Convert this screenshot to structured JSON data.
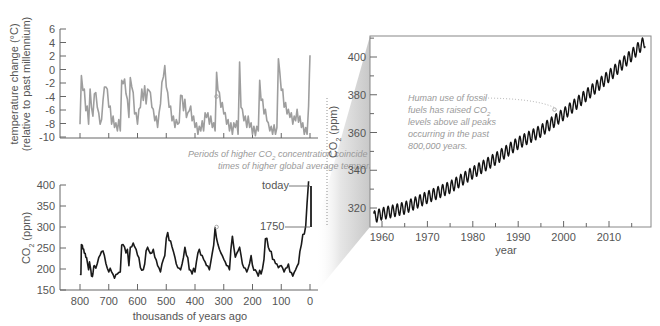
{
  "chart_data": [
    {
      "id": "temperature",
      "type": "line",
      "title": "",
      "xlabel": "",
      "ylabel": "temperature change (°C)",
      "ylabel2": "(relative to past millennium)",
      "xlim": [
        800,
        0
      ],
      "ylim": [
        -10,
        6
      ],
      "yticks": [
        6,
        4,
        2,
        0,
        -2,
        -4,
        -6,
        -8,
        -10
      ],
      "xticks": [
        800,
        700,
        600,
        500,
        400,
        300,
        200,
        100,
        0
      ],
      "color": "#9e9e9e",
      "series": [
        {
          "name": "temperature anomaly",
          "x": [
            800,
            795,
            790,
            785,
            780,
            775,
            770,
            765,
            760,
            755,
            750,
            745,
            740,
            735,
            730,
            725,
            720,
            715,
            710,
            705,
            700,
            695,
            690,
            685,
            680,
            675,
            670,
            665,
            660,
            655,
            650,
            645,
            640,
            635,
            630,
            625,
            620,
            615,
            610,
            605,
            600,
            595,
            590,
            585,
            580,
            575,
            570,
            565,
            560,
            555,
            550,
            545,
            540,
            535,
            530,
            525,
            520,
            515,
            510,
            505,
            500,
            495,
            490,
            485,
            480,
            475,
            470,
            465,
            460,
            455,
            450,
            445,
            440,
            435,
            430,
            425,
            420,
            415,
            410,
            405,
            400,
            395,
            390,
            385,
            380,
            375,
            370,
            365,
            360,
            355,
            350,
            345,
            340,
            335,
            330,
            325,
            320,
            315,
            310,
            305,
            300,
            295,
            290,
            285,
            280,
            275,
            270,
            265,
            260,
            255,
            250,
            245,
            240,
            235,
            230,
            225,
            220,
            215,
            210,
            205,
            200,
            195,
            190,
            185,
            180,
            175,
            170,
            165,
            160,
            155,
            150,
            145,
            140,
            135,
            130,
            125,
            120,
            115,
            110,
            105,
            100,
            95,
            90,
            85,
            80,
            75,
            70,
            65,
            60,
            55,
            50,
            45,
            40,
            35,
            30,
            25,
            20,
            15,
            10,
            5,
            2,
            0
          ],
          "y": [
            -7.5,
            -1.5,
            -2.5,
            -3.5,
            -5.5,
            -6,
            -7.5,
            -3.5,
            -5,
            -7.5,
            -3,
            -4,
            -5,
            -7,
            -7.5,
            -8,
            -4,
            -3.2,
            -2,
            -3.5,
            -5,
            -6,
            -7.5,
            -7.5,
            -8,
            -8.5,
            -8.5,
            -8,
            -8.5,
            -2.2,
            -1.5,
            -2,
            -3,
            -5,
            -6.5,
            -1.8,
            -2,
            -4,
            -6,
            -7,
            -7.5,
            -6.5,
            -5,
            -3.5,
            -4,
            -3,
            -4.5,
            -3.5,
            -2.5,
            -4,
            -5,
            -6.5,
            -7,
            -7.5,
            -8,
            -7,
            -4.5,
            -2.5,
            -0.5,
            0,
            -2,
            -4,
            -5,
            -6,
            -7,
            -7.5,
            -8,
            -8,
            -7.5,
            -8.5,
            -3.2,
            -4.5,
            -5.5,
            -5,
            -6.5,
            -7,
            -5.5,
            -6,
            -7,
            -7.5,
            -8,
            -8.5,
            -9,
            -9,
            -8.5,
            -8.2,
            -8.5,
            -7,
            -6.5,
            -7,
            -7.5,
            -7.5,
            -8,
            -8.5,
            -8.5,
            -1,
            -2.5,
            -4,
            -5,
            -5.5,
            -6,
            -7,
            -7.5,
            -8,
            -8.5,
            -8.5,
            -9,
            -8.5,
            -8,
            -8.2,
            -9,
            0.5,
            -5,
            -6.5,
            -7,
            -7.5,
            -8,
            -7.5,
            -8,
            -8.5,
            -9,
            -9,
            -9.2,
            -9,
            -8.5,
            -2.2,
            -4,
            -5,
            -6,
            -6.5,
            -7,
            -8.5,
            -8.5,
            -9,
            -9,
            -8.8,
            -9,
            -9.2,
            2.2,
            -1,
            -2.5,
            -3.5,
            -5,
            -5.5,
            -6,
            -6.5,
            -6.5,
            -7,
            -7.5,
            -7.5,
            -7,
            -6.5,
            -7.2,
            -7.5,
            -8,
            -8.5,
            -9,
            -9.2,
            -9,
            -6,
            -0.2,
            1.5,
            0.8,
            2.2
          ]
        }
      ],
      "annotation_marker": {
        "x": 325,
        "y": -4
      }
    },
    {
      "id": "co2-ice-core",
      "type": "line",
      "xlabel": "thousands of years ago",
      "ylabel": "CO₂ (ppm)",
      "xlim": [
        800,
        0
      ],
      "ylim": [
        150,
        400
      ],
      "yticks": [
        400,
        350,
        300,
        250,
        200,
        150
      ],
      "xticks": [
        800,
        700,
        600,
        500,
        400,
        300,
        200,
        100,
        0
      ],
      "color": "#1a1a1a",
      "series": [
        {
          "name": "CO2 ice core",
          "x": [
            800,
            797,
            795,
            792,
            790,
            787,
            785,
            782,
            780,
            777,
            775,
            772,
            770,
            767,
            765,
            762,
            760,
            757,
            755,
            752,
            750,
            745,
            740,
            735,
            730,
            725,
            720,
            715,
            710,
            705,
            700,
            695,
            690,
            685,
            680,
            675,
            670,
            665,
            660,
            655,
            650,
            645,
            640,
            635,
            630,
            625,
            620,
            615,
            610,
            605,
            600,
            595,
            590,
            585,
            580,
            575,
            570,
            565,
            560,
            555,
            550,
            545,
            540,
            535,
            530,
            525,
            520,
            515,
            510,
            505,
            500,
            495,
            490,
            485,
            480,
            475,
            470,
            465,
            460,
            455,
            450,
            445,
            440,
            435,
            430,
            425,
            420,
            415,
            410,
            405,
            400,
            395,
            390,
            385,
            380,
            375,
            370,
            365,
            360,
            355,
            350,
            345,
            340,
            335,
            330,
            325,
            320,
            315,
            310,
            305,
            300,
            295,
            290,
            285,
            280,
            275,
            270,
            265,
            260,
            255,
            250,
            245,
            240,
            235,
            230,
            225,
            220,
            215,
            210,
            205,
            200,
            195,
            190,
            185,
            180,
            175,
            170,
            165,
            160,
            155,
            150,
            145,
            140,
            135,
            130,
            125,
            120,
            115,
            110,
            105,
            100,
            95,
            90,
            85,
            80,
            75,
            70,
            65,
            60,
            55,
            50,
            45,
            40,
            35,
            30,
            25,
            20,
            15,
            10,
            5,
            2,
            1,
            0
          ],
          "y": [
            190,
            185,
            260,
            255,
            250,
            245,
            240,
            235,
            230,
            225,
            220,
            205,
            200,
            215,
            210,
            195,
            185,
            180,
            190,
            205,
            210,
            200,
            215,
            225,
            235,
            240,
            245,
            230,
            215,
            200,
            195,
            200,
            195,
            185,
            180,
            185,
            190,
            190,
            195,
            255,
            260,
            250,
            240,
            245,
            210,
            250,
            255,
            260,
            255,
            245,
            235,
            225,
            205,
            195,
            200,
            210,
            245,
            250,
            245,
            235,
            240,
            245,
            230,
            220,
            210,
            200,
            195,
            210,
            225,
            230,
            275,
            285,
            270,
            265,
            255,
            240,
            230,
            210,
            205,
            200,
            200,
            210,
            230,
            250,
            235,
            225,
            200,
            195,
            190,
            200,
            195,
            215,
            240,
            245,
            235,
            230,
            225,
            215,
            210,
            205,
            200,
            215,
            240,
            255,
            300,
            270,
            260,
            245,
            240,
            230,
            225,
            215,
            210,
            205,
            200,
            245,
            280,
            250,
            230,
            235,
            245,
            250,
            235,
            210,
            205,
            200,
            195,
            200,
            215,
            230,
            210,
            195,
            200,
            190,
            185,
            195,
            190,
            200,
            225,
            270,
            275,
            250,
            245,
            240,
            225,
            220,
            215,
            210,
            205,
            205,
            210,
            200,
            195,
            200,
            205,
            210,
            195,
            190,
            185,
            190,
            200,
            205,
            215,
            240,
            260,
            280,
            285,
            300,
            360,
            407
          ]
        }
      ],
      "labels": {
        "today": "today",
        "preindustrial": "1750"
      },
      "annotation_marker": {
        "x": 325,
        "y": 300
      }
    },
    {
      "id": "co2-mauna-loa",
      "type": "line",
      "xlabel": "year",
      "ylabel": "CO₂ (ppm)",
      "xlim": [
        1957,
        2019
      ],
      "ylim": [
        310,
        410
      ],
      "yticks": [
        400,
        380,
        360,
        340,
        320
      ],
      "xticks": [
        1960,
        1970,
        1980,
        1990,
        2000,
        2010
      ],
      "color": "#111111",
      "trend": {
        "years": [
          1958,
          1960,
          1965,
          1970,
          1975,
          1980,
          1985,
          1990,
          1995,
          2000,
          2005,
          2010,
          2015,
          2018
        ],
        "ppm": [
          315,
          316.9,
          320,
          325.7,
          331,
          338.7,
          346,
          354.4,
          360.8,
          369.7,
          379.8,
          389.9,
          401,
          408.5
        ]
      },
      "seasonal_amplitude_ppm": 3.2,
      "annotation_marker": {
        "x": 1998,
        "y": 370
      }
    }
  ],
  "annotations": {
    "center_line1_prefix": "Periods of higher CO",
    "center_line1_sub": "2",
    "center_line1_suffix": " concentration coincide with",
    "center_line2": "times of higher global average temperature.",
    "right_line1": "Human use of fossil",
    "right_line2_prefix": "fuels has raised CO",
    "right_line2_sub": "2",
    "right_line3": "levels above all peaks",
    "right_line4": "occurring in the past",
    "right_line5": "800,000 years."
  },
  "axis_titles": {
    "temp_line1": "temperature change (°C)",
    "temp_line2": "(relative to past millennium)",
    "co2_prefix": "CO",
    "co2_sub": "2",
    "co2_suffix": " (ppm)",
    "bottom_x": "thousands of years ago",
    "right_x": "year"
  }
}
